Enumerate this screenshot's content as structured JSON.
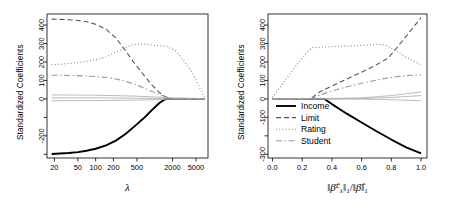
{
  "figure": {
    "panels": [
      {
        "id": "left",
        "ylabel": "Standardized Coefficients",
        "xlabel": "λ",
        "xticks": [
          "20",
          "50",
          "100",
          "200",
          "500",
          "2000",
          "5000"
        ],
        "yticks": [
          "400",
          "300",
          "200",
          "100",
          "0",
          "-200"
        ]
      },
      {
        "id": "right",
        "ylabel": "Standardized Coefficients",
        "xlabel_parts": {
          "lead": "‖",
          "beta1": "β̂",
          "sup1": "L",
          "sub1": "λ",
          "close1": "‖",
          "norm1": "1",
          "slash": "/",
          "open2": "‖",
          "beta2": "β̂",
          "close2": "‖",
          "norm2": "1"
        },
        "xticks": [
          "0.0",
          "0.2",
          "0.4",
          "0.6",
          "0.8",
          "1.0"
        ],
        "yticks": [
          "400",
          "300",
          "200",
          "100",
          "0",
          "-100",
          "-300"
        ]
      }
    ],
    "legend": {
      "position": "bottom-left-of-right-panel",
      "entries": [
        {
          "label": "Income",
          "style": "solid",
          "color": "#000000",
          "width": 1.9
        },
        {
          "label": "Limit",
          "style": "dashed",
          "color": "#555555",
          "width": 1.1
        },
        {
          "label": "Rating",
          "style": "dotted",
          "color": "#888888",
          "width": 1.1
        },
        {
          "label": "Student",
          "style": "dashdot",
          "color": "#999999",
          "width": 1.1
        }
      ]
    }
  },
  "chart_data": [
    {
      "type": "line",
      "title": "",
      "panel": "left",
      "xlabel": "λ",
      "ylabel": "Standardized Coefficients",
      "xscale": "log",
      "xlim": [
        15,
        8000
      ],
      "ylim": [
        -320,
        460
      ],
      "xticks": [
        20,
        50,
        100,
        200,
        500,
        2000,
        5000
      ],
      "yticks": [
        -200,
        0,
        100,
        200,
        300,
        400
      ],
      "grid": false,
      "legend": "none",
      "series": [
        {
          "name": "Income",
          "style": "solid",
          "x": [
            18,
            25,
            35,
            50,
            70,
            100,
            150,
            220,
            320,
            450,
            650,
            900,
            1200,
            1500,
            1800,
            2400,
            3500,
            5000,
            7000
          ],
          "y": [
            -298,
            -296,
            -293,
            -288,
            -281,
            -270,
            -252,
            -226,
            -190,
            -150,
            -105,
            -60,
            -22,
            -2,
            0,
            0,
            0,
            0,
            0
          ]
        },
        {
          "name": "Limit",
          "style": "dashed",
          "x": [
            18,
            25,
            35,
            50,
            70,
            100,
            150,
            220,
            320,
            450,
            650,
            900,
            1200,
            1500,
            1900,
            2300,
            3000,
            5000,
            7000
          ],
          "y": [
            432,
            431,
            429,
            425,
            418,
            404,
            378,
            330,
            262,
            195,
            130,
            75,
            35,
            12,
            2,
            0,
            0,
            0,
            0
          ]
        },
        {
          "name": "Rating",
          "style": "dotted",
          "x": [
            18,
            25,
            35,
            50,
            70,
            100,
            150,
            220,
            320,
            450,
            650,
            900,
            1200,
            1600,
            2200,
            3000,
            4200,
            5600,
            7000
          ],
          "y": [
            185,
            188,
            192,
            197,
            203,
            212,
            228,
            252,
            278,
            295,
            297,
            292,
            288,
            285,
            262,
            215,
            150,
            70,
            8
          ]
        },
        {
          "name": "Student",
          "style": "dashdot",
          "x": [
            18,
            25,
            35,
            50,
            70,
            100,
            150,
            220,
            320,
            450,
            650,
            900,
            1300,
            1800,
            2400,
            3200,
            5000,
            7000
          ],
          "y": [
            128,
            128,
            127,
            126,
            124,
            121,
            116,
            108,
            96,
            80,
            60,
            40,
            20,
            6,
            0,
            0,
            0,
            0
          ]
        },
        {
          "name": "other-1",
          "style": "flat",
          "x": [
            18,
            100,
            500,
            2000,
            7000
          ],
          "y": [
            22,
            20,
            15,
            6,
            2
          ]
        },
        {
          "name": "other-2",
          "style": "flat",
          "x": [
            18,
            100,
            500,
            2000,
            7000
          ],
          "y": [
            -10,
            -9,
            -6,
            -2,
            0
          ]
        },
        {
          "name": "other-3",
          "style": "flat",
          "x": [
            18,
            100,
            500,
            2000,
            7000
          ],
          "y": [
            6,
            6,
            4,
            2,
            0
          ]
        }
      ]
    },
    {
      "type": "line",
      "title": "",
      "panel": "right",
      "xlabel": "||beta-hat^L_lambda||_1 / ||beta-hat||_1",
      "ylabel": "Standardized Coefficients",
      "xscale": "linear",
      "xlim": [
        -0.03,
        1.04
      ],
      "ylim": [
        -320,
        460
      ],
      "xticks": [
        0.0,
        0.2,
        0.4,
        0.6,
        0.8,
        1.0
      ],
      "yticks": [
        -300,
        -100,
        0,
        100,
        200,
        300,
        400
      ],
      "grid": false,
      "legend": "inside-bottom-left",
      "series": [
        {
          "name": "Income",
          "style": "solid",
          "x": [
            0.0,
            0.1,
            0.2,
            0.3,
            0.35,
            0.4,
            0.5,
            0.6,
            0.7,
            0.8,
            0.9,
            1.0
          ],
          "y": [
            0,
            0,
            0,
            0,
            0,
            -28,
            -80,
            -128,
            -175,
            -220,
            -262,
            -295
          ]
        },
        {
          "name": "Limit",
          "style": "dashed",
          "x": [
            0.0,
            0.1,
            0.2,
            0.26,
            0.3,
            0.4,
            0.5,
            0.6,
            0.7,
            0.78,
            0.85,
            0.92,
            1.0
          ],
          "y": [
            0,
            0,
            0,
            0,
            30,
            70,
            108,
            145,
            185,
            222,
            290,
            360,
            440
          ]
        },
        {
          "name": "Rating",
          "style": "dotted",
          "x": [
            0.0,
            0.08,
            0.16,
            0.24,
            0.27,
            0.4,
            0.55,
            0.7,
            0.76,
            0.82,
            0.9,
            1.0
          ],
          "y": [
            8,
            95,
            180,
            260,
            278,
            283,
            288,
            295,
            292,
            265,
            225,
            185
          ]
        },
        {
          "name": "Student",
          "style": "dashdot",
          "x": [
            0.0,
            0.1,
            0.2,
            0.27,
            0.35,
            0.45,
            0.6,
            0.75,
            0.85,
            0.93,
            1.0
          ],
          "y": [
            0,
            0,
            0,
            5,
            30,
            55,
            85,
            110,
            122,
            128,
            130
          ]
        },
        {
          "name": "other-1",
          "style": "flat",
          "x": [
            0.0,
            0.3,
            0.6,
            0.8,
            1.0
          ],
          "y": [
            0,
            0,
            6,
            18,
            38
          ]
        },
        {
          "name": "other-2",
          "style": "flat",
          "x": [
            0.0,
            0.3,
            0.6,
            0.8,
            1.0
          ],
          "y": [
            0,
            0,
            2,
            8,
            18
          ]
        },
        {
          "name": "other-3",
          "style": "flat",
          "x": [
            0.0,
            0.3,
            0.6,
            0.8,
            1.0
          ],
          "y": [
            0,
            0,
            -1,
            -4,
            -10
          ]
        }
      ]
    }
  ]
}
